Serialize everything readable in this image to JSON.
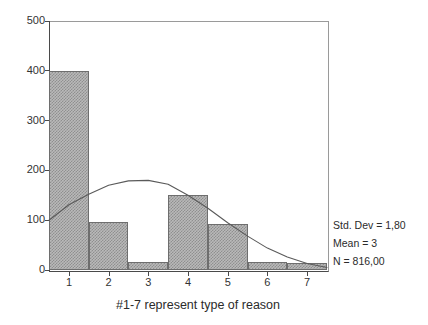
{
  "chart_data": {
    "type": "bar",
    "title": "",
    "subtitle": "",
    "xlabel": "#1-7 represent type of reason",
    "ylabel": "",
    "categories": [
      "1",
      "2",
      "3",
      "4",
      "5",
      "6",
      "7"
    ],
    "values": [
      400,
      97,
      17,
      150,
      93,
      17,
      15
    ],
    "ylim": [
      0,
      500
    ],
    "xlim": [
      0.5,
      7.5
    ],
    "yticks": [
      0,
      100,
      200,
      300,
      400,
      500
    ],
    "ytick_labels": [
      "0",
      "100",
      "200",
      "300",
      "400",
      "500"
    ],
    "xticks": [
      1,
      2,
      3,
      4,
      5,
      6,
      7
    ],
    "xtick_labels": [
      "1",
      "2",
      "3",
      "4",
      "5",
      "6",
      "7"
    ],
    "grid": false,
    "legend": null,
    "legend_position": "none",
    "overlay": {
      "type": "line",
      "name": "normal-curve",
      "mean": 3.0,
      "std_dev": 1.8,
      "n": 816,
      "peak_value": 180,
      "points": [
        {
          "x": 0.5,
          "y": 100
        },
        {
          "x": 1.0,
          "y": 131
        },
        {
          "x": 1.5,
          "y": 152
        },
        {
          "x": 2.0,
          "y": 170
        },
        {
          "x": 2.5,
          "y": 179
        },
        {
          "x": 3.0,
          "y": 180
        },
        {
          "x": 3.5,
          "y": 172
        },
        {
          "x": 4.0,
          "y": 150
        },
        {
          "x": 4.5,
          "y": 124
        },
        {
          "x": 5.0,
          "y": 95
        },
        {
          "x": 5.5,
          "y": 68
        },
        {
          "x": 6.0,
          "y": 44
        },
        {
          "x": 6.5,
          "y": 26
        },
        {
          "x": 7.0,
          "y": 13
        },
        {
          "x": 7.5,
          "y": 5
        }
      ]
    },
    "bar_fill_color": "#b9b9b9",
    "bar_edge_color": "#6e6e6e",
    "curve_color": "#5a5a5a",
    "axis_color": "#4a4a4a"
  },
  "annotations": {
    "std_dev": "Std. Dev = 1,80",
    "mean": "Mean = 3",
    "n": "N = 816,00"
  },
  "axis": {
    "x_title": "#1-7 represent type of reason"
  }
}
